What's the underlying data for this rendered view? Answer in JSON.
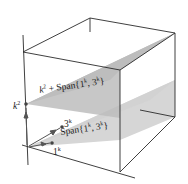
{
  "diagram": {
    "type": "3d-parallel-planes-in-box",
    "labels": {
      "k2_point": "k",
      "k2_exp": "2",
      "upper_plane_prefix": "k",
      "upper_plane_prefix_exp": "2",
      "upper_plane_text": " + Span{1",
      "upper_plane_exp1": "k",
      "upper_plane_mid": ", 3",
      "upper_plane_exp2": "k",
      "upper_plane_end": "}",
      "lower_plane_text": "Span{1",
      "lower_plane_exp1": "k",
      "lower_plane_mid": ", 3",
      "lower_plane_exp2": "k",
      "lower_plane_end": "}",
      "vec_3k": "3",
      "vec_3k_exp": "k",
      "vec_1k": "1",
      "vec_1k_exp": "k"
    },
    "colors": {
      "plane_upper": "#b4b4b4",
      "plane_lower": "#d2d2d2",
      "edge": "#2a2a2a"
    }
  }
}
